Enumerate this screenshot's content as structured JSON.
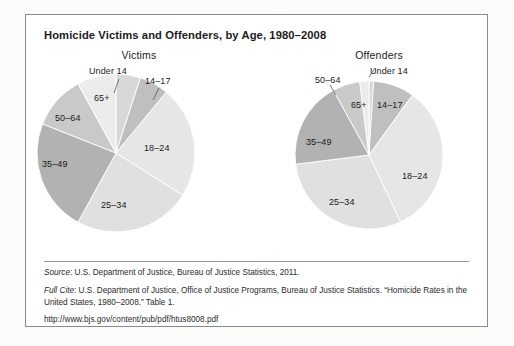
{
  "figure": {
    "title": "Homicide Victims and Offenders, by Age, 1980–2008",
    "source_label": "Source",
    "source_text": ": U.S. Department of Justice, Bureau of Justice Statistics, 2011.",
    "fullcite_label": "Full Cite",
    "fullcite_text": ": U.S. Department of Justice, Office of Justice Programs, Bureau of Justice Statistics. “Homicide Rates in the United States, 1980–2008.” Table 1.",
    "url": "http://www.bjs.gov/content/pub/pdf/htus8008.pdf"
  },
  "colors": {
    "slice_under14": "#d8d8d8",
    "slice_14_17": "#bfbfbf",
    "slice_18_24": "#e6e6e6",
    "slice_25_34": "#e0e0e0",
    "slice_35_49": "#b2b2b2",
    "slice_50_64": "#c9c9c9",
    "slice_65plus": "#ececec",
    "border": "#8a8a8a",
    "text": "#1c1c1c"
  },
  "chart_data": [
    {
      "type": "pie",
      "title": "Victims",
      "categories": [
        "Under 14",
        "14–17",
        "18–24",
        "25–34",
        "35–49",
        "50–64",
        "65+"
      ],
      "values": [
        5,
        6,
        23,
        24,
        23,
        11,
        8
      ],
      "unit": "percent",
      "legend": "none",
      "labels_inline": true,
      "start_angle_deg": 0,
      "direction": "clockwise"
    },
    {
      "type": "pie",
      "title": "Offenders",
      "categories": [
        "Under 14",
        "14–17",
        "18–24",
        "25–34",
        "35–49",
        "50–64",
        "65+"
      ],
      "values": [
        1,
        9,
        33,
        30,
        19,
        6,
        2
      ],
      "unit": "percent",
      "legend": "none",
      "labels_inline": true,
      "start_angle_deg": 0,
      "direction": "clockwise"
    }
  ],
  "victims_labels": {
    "under14": "Under 14",
    "age14_17": "14–17",
    "age18_24": "18–24",
    "age25_34": "25–34",
    "age35_49": "35–49",
    "age50_64": "50–64",
    "age65plus": "65+"
  },
  "offenders_labels": {
    "under14": "Under 14",
    "age14_17": "14–17",
    "age18_24": "18–24",
    "age25_34": "25–34",
    "age35_49": "35–49",
    "age50_64": "50–64",
    "age65plus": "65+"
  }
}
